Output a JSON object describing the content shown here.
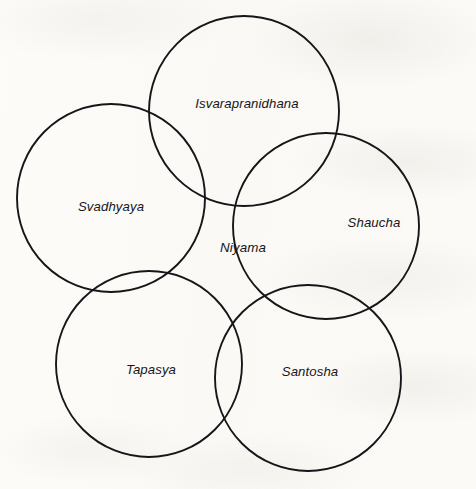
{
  "diagram": {
    "type": "venn-rosette",
    "title_visible": false,
    "background_color": "#fcfbf8",
    "stroke_color": "#16161a",
    "text_color": "#16161a",
    "canvas": {
      "width": 476,
      "height": 489
    },
    "center_region": {
      "label": "Niyama",
      "name": "niyama",
      "x": 243,
      "y": 248
    },
    "circles": [
      {
        "name": "isvarapranidhana",
        "label": "Isvarapranidhana",
        "position": "top",
        "cx": 244,
        "cy": 111,
        "r": 95,
        "label_x": 247,
        "label_y": 105
      },
      {
        "name": "shaucha",
        "label": "Shaucha",
        "position": "right",
        "cx": 326,
        "cy": 226,
        "r": 93,
        "label_x": 374,
        "label_y": 224
      },
      {
        "name": "santosha",
        "label": "Santosha",
        "position": "bottom-right",
        "cx": 308,
        "cy": 378,
        "r": 93,
        "label_x": 310,
        "label_y": 373
      },
      {
        "name": "tapasya",
        "label": "Tapasya",
        "position": "bottom-left",
        "cx": 149,
        "cy": 364,
        "r": 93,
        "label_x": 151,
        "label_y": 371
      },
      {
        "name": "svadhyaya",
        "label": "Svadhyaya",
        "position": "left",
        "cx": 111,
        "cy": 198,
        "r": 94,
        "label_x": 111,
        "label_y": 208
      }
    ]
  }
}
